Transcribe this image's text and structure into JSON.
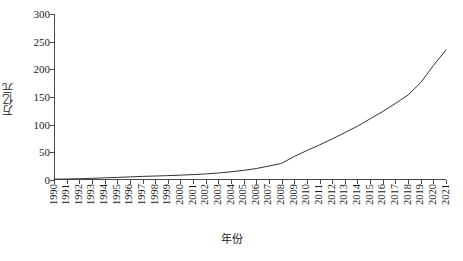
{
  "chart_data": {
    "type": "line",
    "title": "",
    "xlabel": "年份",
    "ylabel": "万亿元",
    "categories": [
      "1990",
      "1991",
      "1992",
      "1993",
      "1994",
      "1995",
      "1996",
      "1997",
      "1998",
      "1999",
      "2000",
      "2001",
      "2002",
      "2003",
      "2004",
      "2005",
      "2006",
      "2007",
      "2008",
      "2009",
      "2010",
      "2011",
      "2012",
      "2013",
      "2014",
      "2015",
      "2016",
      "2017",
      "2018",
      "2019",
      "2020",
      "2021"
    ],
    "values": [
      1.5,
      1.8,
      2.3,
      3.0,
      3.9,
      4.7,
      5.6,
      6.5,
      7.2,
      7.9,
      8.8,
      9.8,
      11.0,
      12.6,
      14.8,
      17.4,
      20.7,
      25.2,
      30.1,
      42.5,
      53.2,
      63.4,
      74.2,
      85.6,
      97.2,
      110.6,
      123.8,
      138.4,
      153.6,
      176.0,
      206.8,
      235.0
    ],
    "ylim": [
      0,
      300
    ],
    "yticks": [
      0,
      50,
      100,
      150,
      200,
      250,
      300
    ],
    "grid": false,
    "legend_position": "none",
    "line_color": "#333333"
  },
  "axes": {
    "y_title": "万亿元",
    "x_title": "年份",
    "y_tick_labels": [
      "300",
      "250",
      "200",
      "150",
      "100",
      "50",
      "0"
    ],
    "x_tick_labels": [
      "1990",
      "1991",
      "1992",
      "1993",
      "1994",
      "1995",
      "1996",
      "1997",
      "1998",
      "1999",
      "2000",
      "2001",
      "2002",
      "2003",
      "2004",
      "2005",
      "2006",
      "2007",
      "2008",
      "2009",
      "2010",
      "2011",
      "2012",
      "2013",
      "2014",
      "2015",
      "2016",
      "2017",
      "2018",
      "2019",
      "2020",
      "2021"
    ]
  }
}
